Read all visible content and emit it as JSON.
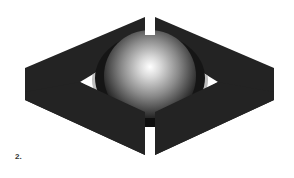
{
  "figure": {
    "label": "2.",
    "colors": {
      "frame": "#232323",
      "background": "#ffffff",
      "sphere_highlight": "#ffffff",
      "sphere_mid": "#8a8a8a",
      "sphere_edge": "#0d0d0d",
      "inner_cutout_shade": "#bdbdbd"
    }
  }
}
